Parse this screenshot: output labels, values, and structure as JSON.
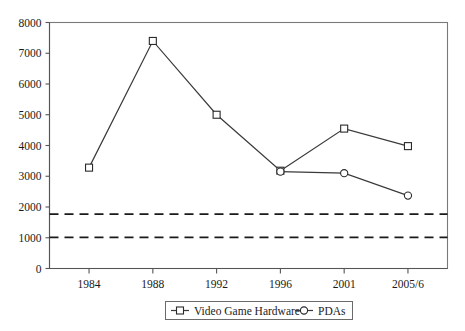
{
  "chart_data": {
    "type": "line",
    "title": "",
    "subtitle": "",
    "xlabel": "",
    "ylabel": "",
    "categories": [
      "1984",
      "1988",
      "1992",
      "1996",
      "2001",
      "2005/6"
    ],
    "ylim": [
      0,
      8000
    ],
    "xlim_index": [
      0,
      5
    ],
    "y_ticks": [
      "0",
      "1000",
      "2000",
      "3000",
      "4000",
      "5000",
      "6000",
      "7000",
      "8000"
    ],
    "y_tick_values": [
      0,
      1000,
      2000,
      3000,
      4000,
      5000,
      6000,
      7000,
      8000
    ],
    "grid": false,
    "legend_position": "bottom-center",
    "series": [
      {
        "name": "Video Game Hardware",
        "marker": "square",
        "values": [
          3280,
          7400,
          5000,
          3180,
          4550,
          3980
        ]
      },
      {
        "name": "PDAs",
        "marker": "circle",
        "values": [
          null,
          null,
          null,
          3150,
          3100,
          2370
        ]
      }
    ],
    "annotations": [
      {
        "name": "upper-threshold",
        "type": "hline",
        "value": 1770,
        "style": "dashed"
      },
      {
        "name": "lower-threshold",
        "type": "hline",
        "value": 1010,
        "style": "dashed"
      }
    ]
  },
  "legend": {
    "entries": [
      {
        "label": "Video Game Hardware",
        "marker": "square"
      },
      {
        "label": "PDAs",
        "marker": "circle"
      }
    ]
  },
  "colors": {
    "line": "#3a3a3a",
    "marker_fill": "#ffffff",
    "marker_stroke": "#2a2a2a",
    "axis": "#555555",
    "border": "#7a7a7a",
    "threshold": "#1a1a1a",
    "text": "#1a1a1a",
    "background": "#ffffff"
  }
}
